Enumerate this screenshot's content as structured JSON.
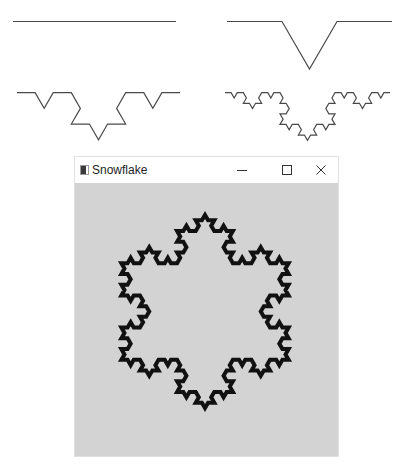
{
  "figure": {
    "curves": [
      {
        "level": 0,
        "x1": 13,
        "x2": 176,
        "y": 21.5
      },
      {
        "level": 1,
        "x1": 227,
        "x2": 392,
        "y": 21.5
      },
      {
        "level": 2,
        "x1": 17,
        "x2": 180,
        "y": 92.7
      },
      {
        "level": 3,
        "x1": 225,
        "x2": 390,
        "y": 92.7
      }
    ],
    "stroke_color": "#4a4a4a",
    "stroke_width": 1.2
  },
  "window": {
    "title": "Snowflake",
    "buttons": {
      "minimize": "minimize",
      "maximize": "maximize",
      "close": "close"
    },
    "canvas": {
      "background": "#d3d3d3",
      "snowflake": {
        "level": 3,
        "center_x": 130,
        "center_y": 128.5,
        "radius": 111.5,
        "stroke_color": "#111111",
        "stroke_width": 4
      }
    }
  }
}
